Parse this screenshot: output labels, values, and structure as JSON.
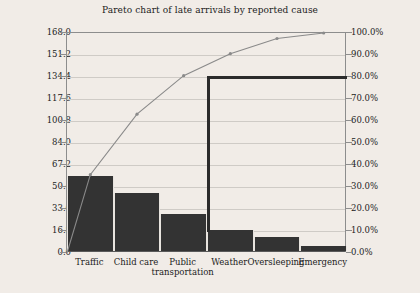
{
  "chart_data": {
    "type": "bar",
    "title": "Pareto chart of late arrivals by reported cause",
    "xlabel": "",
    "ylabel": "",
    "categories": [
      "Traffic",
      "Child care",
      "Public transportation",
      "Weather",
      "Oversleeping",
      "Emergency"
    ],
    "values": [
      57,
      44,
      28,
      16,
      11,
      4
    ],
    "ylim": [
      0,
      168
    ],
    "ytick_labels": [
      "0.0",
      "16.8",
      "33.6",
      "50.4",
      "67.2",
      "84.0",
      "100.8",
      "117.6",
      "134.4",
      "151.2",
      "168.0"
    ],
    "ytick_values": [
      0,
      16.8,
      33.6,
      50.4,
      67.2,
      84.0,
      100.8,
      117.6,
      134.4,
      151.2,
      168.0
    ],
    "secondary_axis": {
      "label": "",
      "ylim": [
        0,
        100
      ],
      "tick_labels": [
        "0.0%",
        "10.0%",
        "20.0%",
        "30.0%",
        "40.0%",
        "50.0%",
        "60.0%",
        "70.0%",
        "80.0%",
        "90.0%",
        "100.0%"
      ],
      "tick_values": [
        0,
        10,
        20,
        30,
        40,
        50,
        60,
        70,
        80,
        90,
        100
      ]
    },
    "series": [
      {
        "name": "Count",
        "type": "bar",
        "values": [
          57,
          44,
          28,
          16,
          11,
          4
        ]
      },
      {
        "name": "Cumulative %",
        "type": "line",
        "values": [
          35.6,
          63.1,
          80.6,
          90.6,
          97.5,
          100.0
        ]
      }
    ],
    "annotations": [
      {
        "name": "eighty-percent-bracket",
        "type": "elbow",
        "value": 80.6,
        "at_category": "Weather"
      }
    ],
    "grid": true,
    "legend": "none",
    "colors": {
      "bar": "#333333",
      "line": "#8a8a8a",
      "annotation": "#2b2b2b",
      "grid": "#cfcbc6",
      "background": "#f1ece7",
      "text": "#1b1b1b"
    }
  }
}
